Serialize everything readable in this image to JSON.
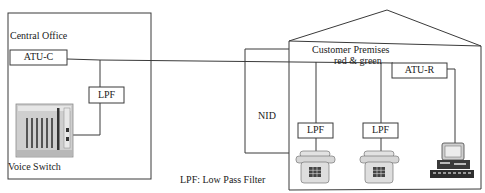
{
  "central_office": {
    "title": "Central Office",
    "atu_c_label": "ATU-C",
    "lpf_label": "LPF",
    "voice_switch_label": "Voice Switch"
  },
  "nid": {
    "label": "NID"
  },
  "customer_premises": {
    "title": "Customer Premises",
    "wiring_label": "red & green",
    "lpf_1_label": "LPF",
    "lpf_2_label": "LPF",
    "atu_r_label": "ATU-R",
    "devices": [
      {
        "type": "telephone-icon"
      },
      {
        "type": "telephone-icon"
      },
      {
        "type": "computer-icon"
      }
    ]
  },
  "legend": {
    "text": "LPF: Low Pass Filter"
  },
  "colors": {
    "line": "#3a3a3a",
    "background": "#ffffff",
    "device_fill": "#d8d8d8"
  }
}
